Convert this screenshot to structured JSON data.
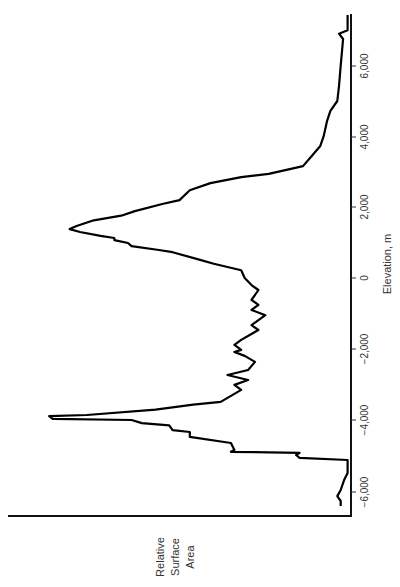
{
  "chart_data": {
    "type": "line",
    "orientation": "rotated-90-ccw",
    "title": "",
    "xlabel": "Elevation, m",
    "ylabel": "Relative Surface Area",
    "ylabel_lines": [
      "Relative",
      "Surface",
      "Area"
    ],
    "xlim": [
      -6800,
      7500
    ],
    "ylim": [
      0,
      1
    ],
    "x_ticks": [
      -6000,
      -4000,
      -2000,
      0,
      2000,
      4000,
      6000
    ],
    "x_tick_labels": [
      "−6,000",
      "−4,000",
      "−2,000",
      "0",
      "2,000",
      "4,000",
      "6,000"
    ],
    "grid": false,
    "legend": null,
    "series": [
      {
        "name": "Hypsographic curve",
        "color": "#000000",
        "x": [
          7430,
          7000,
          6900,
          6750,
          6000,
          5420,
          5000,
          4720,
          4430,
          4000,
          3720,
          3380,
          3160,
          2940,
          2850,
          2680,
          2480,
          2200,
          2090,
          1890,
          1760,
          1630,
          1470,
          1380,
          1300,
          1190,
          1130,
          1070,
          990,
          900,
          790,
          730,
          510,
          400,
          220,
          0,
          -200,
          -340,
          -480,
          -620,
          -760,
          -900,
          -1050,
          -1330,
          -1470,
          -1750,
          -1890,
          -2030,
          -2090,
          -2200,
          -2370,
          -2600,
          -2740,
          -2880,
          -3020,
          -3160,
          -3500,
          -3580,
          -3720,
          -3870,
          -3900,
          -3980,
          -4010,
          -4100,
          -4160,
          -4300,
          -4350,
          -4490,
          -4660,
          -4860,
          -4910,
          -4940,
          -5000,
          -5080,
          -5140,
          -5280,
          -5510,
          -5710,
          -5990,
          -6160,
          -6300,
          -6440
        ],
        "values": [
          0.01,
          0.01,
          0.035,
          0.023,
          0.03,
          0.035,
          0.04,
          0.06,
          0.07,
          0.08,
          0.09,
          0.12,
          0.14,
          0.24,
          0.32,
          0.41,
          0.47,
          0.5,
          0.55,
          0.63,
          0.67,
          0.75,
          0.8,
          0.82,
          0.79,
          0.73,
          0.69,
          0.69,
          0.65,
          0.64,
          0.56,
          0.52,
          0.44,
          0.4,
          0.32,
          0.31,
          0.29,
          0.27,
          0.28,
          0.29,
          0.27,
          0.29,
          0.25,
          0.29,
          0.27,
          0.32,
          0.34,
          0.32,
          0.34,
          0.31,
          0.28,
          0.3,
          0.36,
          0.3,
          0.34,
          0.32,
          0.38,
          0.46,
          0.57,
          0.77,
          0.88,
          0.87,
          0.64,
          0.61,
          0.53,
          0.52,
          0.47,
          0.47,
          0.35,
          0.34,
          0.35,
          0.15,
          0.16,
          0.15,
          0.01,
          0.01,
          0.01,
          0.02,
          0.03,
          0.04,
          0.03,
          0.03
        ]
      }
    ],
    "annotations": [
      {
        "text": "continental peak",
        "x": 1380,
        "y": 0.82
      },
      {
        "text": "oceanic peak",
        "x": -3900,
        "y": 0.88
      }
    ]
  }
}
